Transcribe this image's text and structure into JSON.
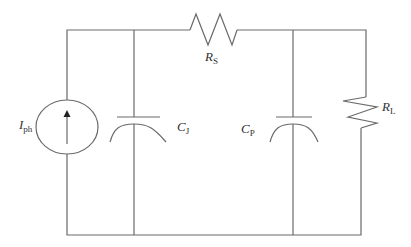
{
  "diagram": {
    "type": "circuit",
    "title": "",
    "components": [
      {
        "id": "Iph",
        "kind": "current-source",
        "label": "I",
        "subscript": "ph"
      },
      {
        "id": "CJ",
        "kind": "capacitor",
        "label": "C",
        "subscript": "J"
      },
      {
        "id": "RS",
        "kind": "resistor",
        "label": "R",
        "subscript": "S"
      },
      {
        "id": "CP",
        "kind": "capacitor",
        "label": "C",
        "subscript": "P"
      },
      {
        "id": "RL",
        "kind": "resistor",
        "label": "R",
        "subscript": "L"
      }
    ],
    "connections": [
      "Iph parallel CJ",
      "RS series between CJ node and CP node",
      "CP parallel RL"
    ],
    "colors": {
      "wire": "#6a6a6a",
      "text": "#333333",
      "background": "#ffffff"
    }
  }
}
